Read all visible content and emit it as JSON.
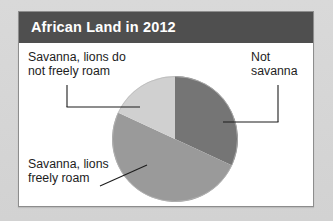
{
  "card": {
    "title": "African Land in 2012"
  },
  "labels": {
    "top_left": "Savanna, lions do\nnot freely roam",
    "top_right": "Not\nsavanna",
    "bottom_left": "Savanna, lions\nfreely roam"
  },
  "colors": {
    "page_background": "#d6d6d6",
    "card_background": "#ffffff",
    "card_border": "#8d8d8d",
    "header_background": "#4f4f4f",
    "header_text": "#ffffff",
    "label_text": "#1d1d1d",
    "leader_line": "#1d1d1d",
    "slice_not_savanna": "#757575",
    "slice_savanna_freely_roam": "#9a9a9a",
    "slice_savanna_not_freely_roam": "#d0d0d0"
  },
  "chart_data": {
    "type": "pie",
    "title": "African Land in 2012",
    "xlabel": "",
    "ylabel": "",
    "legend_position": "none",
    "grid": false,
    "start_angle_deg": 90,
    "direction": "clockwise",
    "categories": [
      "Not savanna",
      "Savanna, lions freely roam",
      "Savanna, lions do not freely roam"
    ],
    "values": [
      32,
      50,
      18
    ],
    "units": "percent of African land",
    "slices": [
      {
        "label": "Not savanna",
        "value": 32,
        "color": "#757575",
        "start_deg": 0,
        "end_deg": 115,
        "label_position": "top-right",
        "leader": "elbow"
      },
      {
        "label": "Savanna, lions freely roam",
        "value": 50,
        "color": "#9a9a9a",
        "start_deg": 115,
        "end_deg": 295,
        "label_position": "bottom-left",
        "leader": "diagonal"
      },
      {
        "label": "Savanna, lions do not freely roam",
        "value": 18,
        "color": "#d0d0d0",
        "start_deg": 295,
        "end_deg": 360,
        "label_position": "top-left",
        "leader": "elbow"
      }
    ]
  }
}
